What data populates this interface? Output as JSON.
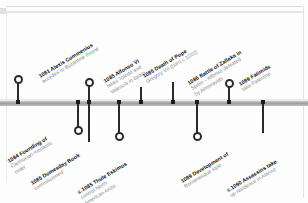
{
  "document": {
    "kind": "historical-timeline",
    "orientation": "horizontal",
    "label_angle_deg": -31
  },
  "axis": {
    "color": "#9e9e9e",
    "marker_color": "#1c1c1c"
  },
  "events": [
    {
      "id": "alexis-commenius",
      "year": "1081",
      "title": "1081 Alexis Commenius",
      "detail": "accedes to Byzantine throne",
      "detail2": "",
      "side": "above",
      "axis_x": 17,
      "stem_top": 82,
      "marker": "ring",
      "label_x": 44,
      "label_y": 72
    },
    {
      "id": "carthusian-order",
      "year": "1084",
      "title": "1084 Founding of",
      "detail": "Carthusian monastic",
      "detail2": "order",
      "side": "below",
      "axis_x": 77,
      "stem_top": 127,
      "marker": "ring",
      "label_x": 16,
      "label_y": 156
    },
    {
      "id": "domesday-book",
      "year": "1085",
      "title": "1085 Domesday Book",
      "detail": "commissioned",
      "detail2": "",
      "side": "below",
      "axis_x": 88,
      "stem_top": 142,
      "marker": "plain",
      "label_x": 36,
      "label_y": 179
    },
    {
      "id": "alfonso-vi",
      "year": "1085",
      "title": "1085 Alfonso VI",
      "detail": "takes Toledo and",
      "detail2": "Valencia in Spain",
      "side": "above",
      "axis_x": 88,
      "stem_top": 85,
      "marker": "ring",
      "label_x": 112,
      "label_y": 76
    },
    {
      "id": "thule-eskimos",
      "year": "c.1085",
      "title": "c.1085 Thule Eskimos",
      "detail": "control North",
      "detail2": "American Arctic",
      "side": "below",
      "axis_x": 118,
      "stem_top": 133,
      "marker": "ring",
      "label_x": 86,
      "label_y": 187
    },
    {
      "id": "pope-gregory-vii",
      "year": "1085",
      "title": "1085 Death of Pope",
      "detail": "Gregory VII (born c.1020)",
      "detail2": "",
      "side": "above",
      "axis_x": 140,
      "stem_top": 87,
      "marker": "plain",
      "label_x": 148,
      "label_y": 72
    },
    {
      "id": "battle-of-zallaka",
      "year": "1086",
      "title": "1086 Battle of Zallaka in",
      "detail": "Spain – Alfonso defeated",
      "detail2": "by Almoravids",
      "side": "above",
      "axis_x": 172,
      "stem_top": 82,
      "marker": "plain",
      "label_x": 196,
      "label_y": 78
    },
    {
      "id": "romanesque-style",
      "year": "1089",
      "title": "1089 Development of",
      "detail": "Romanesque style",
      "detail2": "",
      "side": "below",
      "axis_x": 196,
      "stem_top": 133,
      "marker": "ring",
      "label_x": 186,
      "label_y": 177
    },
    {
      "id": "fatimids-palestine",
      "year": "1089",
      "title": "1089 Fatimids",
      "detail": "take Palestine",
      "detail2": "",
      "side": "above",
      "axis_x": 228,
      "stem_top": 86,
      "marker": "ring",
      "label_x": 244,
      "label_y": 80
    },
    {
      "id": "assassins-alamut",
      "year": "c.1090",
      "title": "c.1090 Assassins take",
      "detail": "up residence in Alamut",
      "detail2": "",
      "side": "below",
      "axis_x": 262,
      "stem_top": 133,
      "marker": "plain",
      "label_x": 232,
      "label_y": 186
    }
  ]
}
